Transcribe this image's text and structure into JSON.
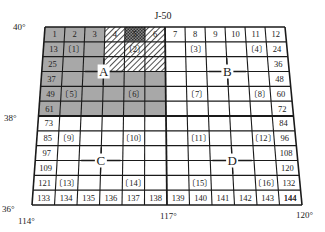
{
  "sheet": {
    "title": "J-50",
    "corners": {
      "top_left": [
        45,
        27
      ],
      "top_right": [
        285,
        27
      ],
      "bottom_left": [
        32,
        205
      ],
      "bottom_right": [
        302,
        205
      ]
    },
    "rows": 12,
    "cols": 12
  },
  "axis_labels": {
    "lat_top": "40°",
    "lat_mid": "38°",
    "lat_bottom": "36°",
    "lon_left": "114°",
    "lon_mid": "117°",
    "lon_right": "120°"
  },
  "quadrants": [
    {
      "label": "A",
      "row": 3,
      "col": 3
    },
    {
      "label": "B",
      "row": 3,
      "col": 9
    },
    {
      "label": "C",
      "row": 9,
      "col": 3
    },
    {
      "label": "D",
      "row": 9,
      "col": 9
    }
  ],
  "edge_numbers": {
    "top_row": [
      "1",
      "2",
      "3",
      "4",
      "5",
      "6",
      "7",
      "8",
      "9",
      "10",
      "11",
      "12"
    ],
    "left_col": [
      "1",
      "13",
      "25",
      "37",
      "49",
      "61",
      "73",
      "85",
      "97",
      "109",
      "121",
      "133"
    ],
    "right_col": [
      "12",
      "24",
      "36",
      "48",
      "60",
      "72",
      "84",
      "96",
      "108",
      "120",
      "132",
      "144"
    ],
    "bottom_row": [
      "133",
      "134",
      "135",
      "136",
      "137",
      "138",
      "139",
      "140",
      "141",
      "142",
      "143",
      "144"
    ]
  },
  "bracket_labels": [
    {
      "text": "〔1〕",
      "row": 1,
      "col": 1
    },
    {
      "text": "〔2〕",
      "row": 1,
      "col": 4
    },
    {
      "text": "〔3〕",
      "row": 1,
      "col": 7
    },
    {
      "text": "〔4〕",
      "row": 1,
      "col": 10
    },
    {
      "text": "〔5〕",
      "row": 4,
      "col": 1
    },
    {
      "text": "〔6〕",
      "row": 4,
      "col": 4
    },
    {
      "text": "〔7〕",
      "row": 4,
      "col": 7
    },
    {
      "text": "〔8〕",
      "row": 4,
      "col": 10
    },
    {
      "text": "〔9〕",
      "row": 7,
      "col": 1
    },
    {
      "text": "〔10〕",
      "row": 7,
      "col": 4
    },
    {
      "text": "〔11〕",
      "row": 7,
      "col": 7
    },
    {
      "text": "〔12〕",
      "row": 7,
      "col": 10
    },
    {
      "text": "〔13〕",
      "row": 10,
      "col": 1
    },
    {
      "text": "〔14〕",
      "row": 10,
      "col": 4
    },
    {
      "text": "〔15〕",
      "row": 10,
      "col": 7
    },
    {
      "text": "〔16〕",
      "row": 10,
      "col": 10
    }
  ],
  "shading": {
    "gray_region": {
      "rows": [
        0,
        5
      ],
      "cols": [
        0,
        5
      ],
      "color": "#a8a8a8"
    },
    "hatched_region": {
      "rows": [
        0,
        2
      ],
      "cols": [
        3,
        5
      ]
    },
    "crosshatched_cell": {
      "row": 0,
      "col": 4
    }
  },
  "colors": {
    "line": "#1a1a1a",
    "gray": "#a8a8a8",
    "white": "#ffffff"
  }
}
